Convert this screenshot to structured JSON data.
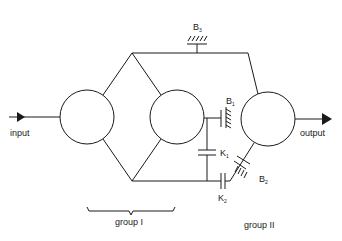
{
  "diagram": {
    "type": "transmission-schematic",
    "colors": {
      "stroke": "#1a1a1a",
      "background": "#ffffff"
    },
    "labels": {
      "input": "input",
      "output": "output",
      "group1": "group  I",
      "group2": "group  II"
    },
    "elements": {
      "B3": {
        "letter": "B",
        "sub": "3",
        "kind": "brake"
      },
      "B1": {
        "letter": "B",
        "sub": "1",
        "kind": "brake"
      },
      "B2": {
        "letter": "B",
        "sub": "2",
        "kind": "brake"
      },
      "K1": {
        "letter": "K",
        "sub": "1",
        "kind": "clutch"
      },
      "K2": {
        "letter": "K",
        "sub": "2",
        "kind": "clutch"
      }
    },
    "nodes": [
      {
        "id": "gearset-1",
        "cx": 87,
        "cy": 117,
        "r": 27
      },
      {
        "id": "gearset-2",
        "cx": 177,
        "cy": 117,
        "r": 27
      },
      {
        "id": "gearset-3",
        "cx": 268,
        "cy": 119,
        "r": 27
      }
    ]
  }
}
